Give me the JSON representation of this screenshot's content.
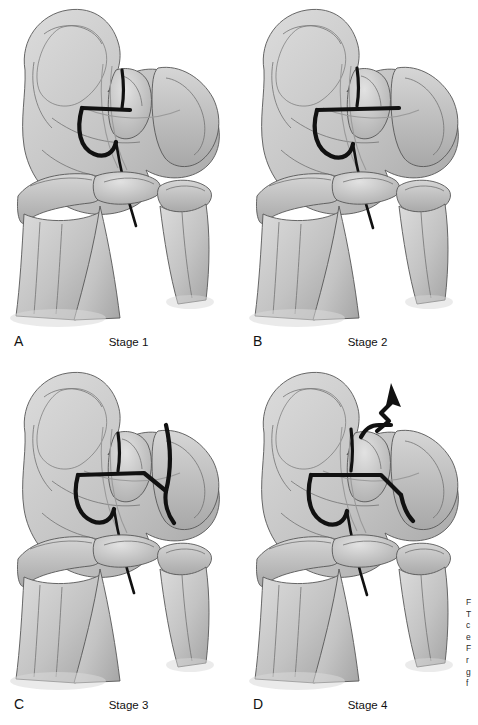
{
  "figure": {
    "background_color": "#ffffff",
    "ink_color": "#111111",
    "bone_fill_color": "#c9c9c9",
    "bone_shadow_color": "#9e9e9e",
    "tear_line_color": "#111111",
    "layout": "2x2 grid of anatomical illustrations"
  },
  "panels": [
    {
      "letter": "A",
      "caption": "Stage 1",
      "stage_number": 1,
      "description": "Femoral condyle with partial arc tear line and probe"
    },
    {
      "letter": "B",
      "caption": "Stage 2",
      "stage_number": 2,
      "description": "Tear line extended horizontally across the fragment"
    },
    {
      "letter": "C",
      "caption": "Stage 3",
      "stage_number": 3,
      "description": "Tear line with lateral vertical extension outlining the fragment"
    },
    {
      "letter": "D",
      "caption": "Stage 4",
      "stage_number": 4,
      "description": "Completely detached fragment displaced upward, shown by arrow"
    }
  ],
  "side_caption": {
    "clipped": true,
    "lines": [
      "F",
      "T",
      "c",
      "e",
      "F",
      "r",
      "g",
      "f"
    ]
  }
}
